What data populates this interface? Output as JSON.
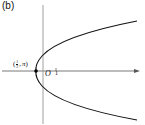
{
  "figure": {
    "panel_label": "(b)",
    "origin_label": "O",
    "tick_label": "1",
    "point_label": {
      "open": "(",
      "numerator": "1",
      "denominator": "2",
      "sep": ",",
      "angle": "π",
      "close": ")"
    },
    "colors": {
      "curve": "#111111",
      "axis": "#555555",
      "point": "#000000"
    }
  }
}
